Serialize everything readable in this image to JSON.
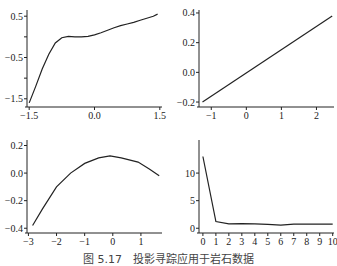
{
  "caption": "图 5.17　投影寻踪应用于岩石数据",
  "chart_data": [
    {
      "type": "line",
      "title": "",
      "xlabel": "",
      "ylabel": "",
      "xlim": [
        -1.55,
        1.55
      ],
      "ylim": [
        -1.65,
        0.65
      ],
      "xticks": [
        {
          "v": -1.5,
          "label": "-1.5"
        },
        {
          "v": 0.0,
          "label": "0.0"
        },
        {
          "v": 1.5,
          "label": "1.5"
        }
      ],
      "yticks": [
        {
          "v": 0.5,
          "label": "0.5"
        },
        {
          "v": 0.0,
          "label": ""
        },
        {
          "v": -0.5,
          "label": "-0.5"
        },
        {
          "v": -1.0,
          "label": ""
        },
        {
          "v": -1.5,
          "label": "-1.5"
        }
      ],
      "x": [
        -1.5,
        -1.35,
        -1.2,
        -1.05,
        -0.9,
        -0.75,
        -0.6,
        -0.45,
        -0.3,
        -0.15,
        0.0,
        0.15,
        0.3,
        0.45,
        0.6,
        0.75,
        0.9,
        1.05,
        1.2,
        1.35,
        1.45
      ],
      "y": [
        -1.6,
        -1.2,
        -0.78,
        -0.42,
        -0.15,
        -0.02,
        0.01,
        0.0,
        0.0,
        0.01,
        0.05,
        0.1,
        0.16,
        0.22,
        0.27,
        0.31,
        0.35,
        0.4,
        0.45,
        0.5,
        0.55
      ]
    },
    {
      "type": "line",
      "title": "",
      "xlabel": "",
      "ylabel": "",
      "xlim": [
        -1.35,
        2.5
      ],
      "ylim": [
        -0.22,
        0.42
      ],
      "xticks": [
        {
          "v": -1,
          "label": "-1"
        },
        {
          "v": 0,
          "label": "0"
        },
        {
          "v": 1,
          "label": "1"
        },
        {
          "v": 2,
          "label": "2"
        }
      ],
      "yticks": [
        {
          "v": 0.4,
          "label": "0.4"
        },
        {
          "v": 0.2,
          "label": "0.2"
        },
        {
          "v": 0.0,
          "label": "0.0"
        },
        {
          "v": -0.2,
          "label": "-0.2"
        }
      ],
      "x": [
        -1.25,
        2.45
      ],
      "y": [
        -0.2,
        0.38
      ]
    },
    {
      "type": "line",
      "title": "",
      "xlabel": "",
      "ylabel": "",
      "xlim": [
        -3.05,
        1.75
      ],
      "ylim": [
        -0.42,
        0.24
      ],
      "xticks": [
        {
          "v": -3,
          "label": "-3"
        },
        {
          "v": -2,
          "label": "-2"
        },
        {
          "v": -1,
          "label": "-1"
        },
        {
          "v": 0,
          "label": "0"
        },
        {
          "v": 1,
          "label": "1"
        }
      ],
      "yticks": [
        {
          "v": 0.2,
          "label": "0.2"
        },
        {
          "v": 0.0,
          "label": "0.0"
        },
        {
          "v": -0.2,
          "label": "-0.2"
        },
        {
          "v": -0.4,
          "label": "-0.4"
        }
      ],
      "x": [
        -2.85,
        -2.5,
        -2.0,
        -1.5,
        -1.0,
        -0.5,
        -0.1,
        0.3,
        0.9,
        1.3,
        1.65
      ],
      "y": [
        -0.38,
        -0.26,
        -0.1,
        0.0,
        0.07,
        0.11,
        0.125,
        0.11,
        0.08,
        0.03,
        -0.02
      ]
    },
    {
      "type": "line",
      "title": "",
      "xlabel": "",
      "ylabel": "",
      "xlim": [
        -0.3,
        10.1
      ],
      "ylim": [
        -0.5,
        16
      ],
      "xticks": [
        {
          "v": 0,
          "label": "0"
        },
        {
          "v": 1,
          "label": "1"
        },
        {
          "v": 2,
          "label": "2"
        },
        {
          "v": 3,
          "label": "3"
        },
        {
          "v": 4,
          "label": "4"
        },
        {
          "v": 5,
          "label": "5"
        },
        {
          "v": 6,
          "label": "6"
        },
        {
          "v": 7,
          "label": "7"
        },
        {
          "v": 8,
          "label": "8"
        },
        {
          "v": 9,
          "label": "9"
        },
        {
          "v": 10,
          "label": "10"
        }
      ],
      "yticks": [
        {
          "v": 10,
          "label": "10"
        },
        {
          "v": 5,
          "label": "5"
        },
        {
          "v": 0,
          "label": "0"
        }
      ],
      "x": [
        0,
        1,
        2,
        3,
        4,
        5,
        6,
        7,
        8,
        9,
        10
      ],
      "y": [
        13.0,
        1.2,
        0.8,
        0.85,
        0.8,
        0.7,
        0.55,
        0.75,
        0.75,
        0.75,
        0.75
      ]
    }
  ]
}
